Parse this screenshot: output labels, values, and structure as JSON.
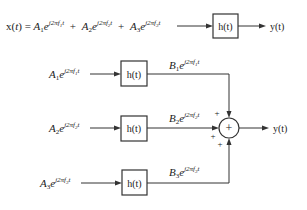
{
  "diagram": {
    "top": {
      "input_label": {
        "prefix": "x(",
        "var": "t",
        "suffix": ") = ",
        "terms": [
          {
            "A": "A",
            "sub": "1",
            "exp": "j2πf",
            "fsub": "1",
            "t": "t"
          },
          {
            "A": "A",
            "sub": "2",
            "exp": "j2πf",
            "fsub": "2",
            "t": "t"
          },
          {
            "A": "A",
            "sub": "3",
            "exp": "j2πf",
            "fsub": "3",
            "t": "t"
          }
        ]
      },
      "plus": "+",
      "block_label": "h(t)",
      "output_label": "y(t)"
    },
    "branches": [
      {
        "input": {
          "A": "A",
          "sub": "1",
          "exp": "j2πf",
          "fsub": "1",
          "t": "t"
        },
        "block_label": "h(t)",
        "output": {
          "B": "B",
          "sub": "1",
          "exp": "j2πf",
          "fsub": "1",
          "t": "t"
        }
      },
      {
        "input": {
          "A": "A",
          "sub": "2",
          "exp": "j2πf",
          "fsub": "2",
          "t": "t"
        },
        "block_label": "h(t)",
        "output": {
          "B": "B",
          "sub": "2",
          "exp": "j2πf",
          "fsub": "2",
          "t": "t"
        }
      },
      {
        "input": {
          "A": "A",
          "sub": "3",
          "exp": "j2πf",
          "fsub": "3",
          "t": "t"
        },
        "block_label": "h(t)",
        "output": {
          "B": "B",
          "sub": "3",
          "exp": "j2πf",
          "fsub": "3",
          "t": "t"
        }
      }
    ],
    "summer": {
      "symbol": "+",
      "input_signs": [
        "+",
        "+",
        "+"
      ],
      "output_label": "y(t)"
    },
    "e": "e"
  }
}
